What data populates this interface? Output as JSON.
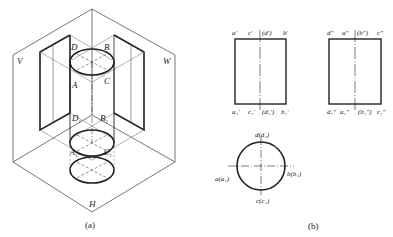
{
  "figure_a": {
    "caption": "(a)",
    "planes": {
      "v": "V",
      "w": "W",
      "h": "H"
    },
    "points": {
      "D": "D",
      "B": "B",
      "A": "A",
      "C": "C",
      "D1": "D",
      "D1_sub": "1",
      "B1": "B",
      "B1_sub": "1",
      "A1": "A",
      "A1_sub": "1",
      "C1": "C",
      "C1_sub": "1"
    }
  },
  "figure_b": {
    "caption": "(b)",
    "front_view": {
      "top_labels": [
        "a'",
        "c'",
        "(d')",
        "b'"
      ],
      "bottom_labels": [
        "a₁'",
        "c₁'",
        "(d₁')",
        "b₁'"
      ]
    },
    "side_view": {
      "top_labels": [
        "d\"",
        "a\"",
        "(b\")",
        "c\""
      ],
      "bottom_labels": [
        "d₁\"",
        "a₁\"",
        "(b₁\")",
        "c₁\""
      ]
    },
    "top_view": {
      "top": "d(d₁)",
      "left": "a(a₁)",
      "right": "b(b₁)",
      "bottom": "c(c₁)"
    }
  },
  "colors": {
    "line": "#222222",
    "thin": "#555555",
    "background": "#ffffff"
  }
}
